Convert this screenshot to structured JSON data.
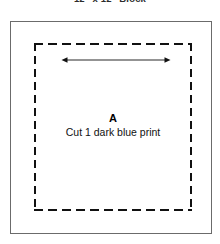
{
  "diagram": {
    "title": "12\" x 12\" Block",
    "piece_label": "A",
    "cut_instruction": "Cut 1 dark blue print",
    "block_outline": {
      "name": "finished-block-outline",
      "style": "solid",
      "color": "#6b6b6b"
    },
    "cut_line": {
      "name": "cutting-line",
      "style": "dashed",
      "color": "#111111"
    },
    "width_arrow": {
      "name": "width-dimension-arrow",
      "style": "double-headed",
      "orientation": "horizontal",
      "color": "#111111"
    },
    "colors": {
      "background": "#ffffff",
      "outline": "#6b6b6b",
      "dashes": "#111111",
      "text": "#111111",
      "title": "#2b2b2b"
    }
  }
}
